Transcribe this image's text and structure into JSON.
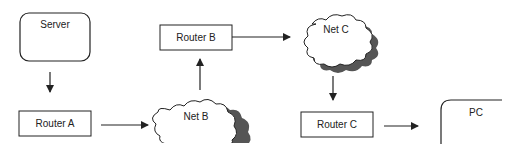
{
  "colors": {
    "stroke": "#222222",
    "shadow": "#555555",
    "background": "#ffffff"
  },
  "nodes": {
    "server": {
      "label": "Server",
      "shape": "rounded-rect"
    },
    "router_a": {
      "label": "Router A",
      "shape": "rect"
    },
    "net_b": {
      "label": "Net B",
      "shape": "cloud"
    },
    "router_b": {
      "label": "Router B",
      "shape": "rect"
    },
    "net_c": {
      "label": "Net C",
      "shape": "cloud"
    },
    "router_c": {
      "label": "Router C",
      "shape": "rect"
    },
    "pc": {
      "label": "PC",
      "shape": "rounded-rect-partial"
    }
  },
  "edges": [
    {
      "from": "Server",
      "to": "Router A"
    },
    {
      "from": "Router A",
      "to": "Net B"
    },
    {
      "from": "Net B",
      "to": "Router B"
    },
    {
      "from": "Router B",
      "to": "Net C"
    },
    {
      "from": "Net C",
      "to": "Router C"
    },
    {
      "from": "Router C",
      "to": "PC"
    }
  ]
}
